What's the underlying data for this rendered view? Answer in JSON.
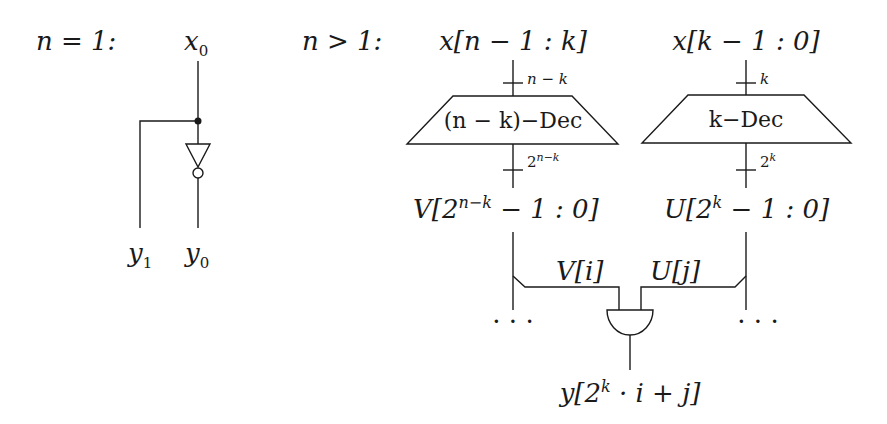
{
  "case_base": {
    "heading": "n = 1:",
    "input_label": "x",
    "input_sub": "0",
    "output_left": "y",
    "output_left_sub": "1",
    "output_right": "y",
    "output_right_sub": "0",
    "gate": "inverter"
  },
  "case_recursive": {
    "heading": "n > 1:",
    "left_input": "x[n − 1 : k]",
    "left_width": "n − k",
    "left_decoder": "(n − k)−Dec",
    "left_out_width_base": "2",
    "left_out_width_exp": "n−k",
    "left_output_pre": "V[2",
    "left_output_exp": "n−k",
    "left_output_post": " − 1 : 0]",
    "right_input": "x[k − 1 : 0]",
    "right_width": "k",
    "right_decoder": "k−Dec",
    "right_out_width_base": "2",
    "right_out_width_exp": "k",
    "right_output_pre": "U[2",
    "right_output_exp": "k",
    "right_output_post": " − 1 : 0]",
    "tap_left": "V[i]",
    "tap_right": "U[j]",
    "ellipsis_left": "· · ·",
    "ellipsis_right": "· · ·",
    "gate": "and",
    "result_pre": "y[2",
    "result_exp": "k",
    "result_post": " · i + j]"
  },
  "colors": {
    "stroke": "#1a1a1a",
    "background": "#ffffff"
  }
}
